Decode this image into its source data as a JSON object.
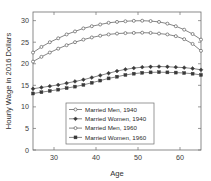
{
  "chart_data": {
    "type": "line",
    "title": "",
    "xlabel": "Age",
    "ylabel": "Hourly Wage in 2016 Dollars",
    "xlim": [
      25,
      65
    ],
    "ylim": [
      0,
      32
    ],
    "xticks": [
      30,
      40,
      50,
      60
    ],
    "yticks": [
      0,
      5,
      10,
      15,
      20,
      25,
      30
    ],
    "xtick_labels": [
      "30",
      "40",
      "50",
      "60"
    ],
    "ytick_labels": [
      "0",
      "5",
      "10",
      "15",
      "20",
      "25",
      "30"
    ],
    "grid": false,
    "legend_position": "lower center",
    "x": [
      25,
      27,
      29,
      31,
      33,
      35,
      37,
      39,
      41,
      43,
      45,
      47,
      49,
      51,
      53,
      55,
      57,
      59,
      61,
      63,
      65
    ],
    "series": [
      {
        "name": "Married Men, 1940",
        "marker": "open-circle",
        "values": [
          22.6,
          23.9,
          25.0,
          25.9,
          26.8,
          27.5,
          28.2,
          28.7,
          29.1,
          29.5,
          29.7,
          29.85,
          29.95,
          29.98,
          29.9,
          29.7,
          29.3,
          28.7,
          27.9,
          26.9,
          25.6
        ]
      },
      {
        "name": "Married Women, 1940",
        "marker": "filled-diamond",
        "values": [
          14.2,
          14.5,
          14.8,
          15.1,
          15.5,
          15.9,
          16.3,
          16.8,
          17.3,
          17.8,
          18.3,
          18.7,
          19.0,
          19.2,
          19.3,
          19.35,
          19.3,
          19.2,
          19.1,
          18.9,
          18.6
        ]
      },
      {
        "name": "Married Men, 1960",
        "marker": "open-circle",
        "values": [
          20.5,
          21.6,
          22.6,
          23.5,
          24.3,
          25.0,
          25.6,
          26.1,
          26.5,
          26.8,
          27.0,
          27.1,
          27.15,
          27.2,
          27.15,
          27.0,
          26.8,
          26.4,
          25.7,
          24.6,
          23.0
        ]
      },
      {
        "name": "Married Women, 1960",
        "marker": "filled-square",
        "values": [
          13.1,
          13.4,
          13.7,
          14.0,
          14.35,
          14.7,
          15.1,
          15.6,
          16.1,
          16.6,
          17.0,
          17.4,
          17.7,
          17.9,
          18.0,
          18.05,
          18.0,
          17.95,
          17.85,
          17.7,
          17.4
        ]
      }
    ]
  },
  "legend": {
    "entries": [
      {
        "label": "Married Men, 1940"
      },
      {
        "label": "Married Women, 1940"
      },
      {
        "label": "Married Men, 1960"
      },
      {
        "label": "Married Women, 1960"
      }
    ]
  },
  "colors": {
    "line": "#5d5d5d",
    "axis": "#6e6e6e",
    "text": "#2a2a2a",
    "background": "#ffffff"
  }
}
